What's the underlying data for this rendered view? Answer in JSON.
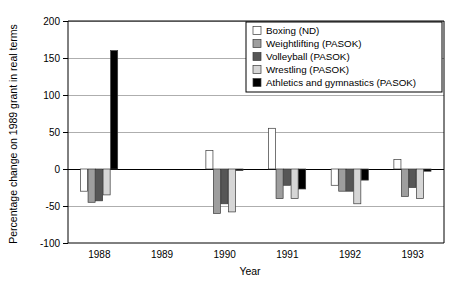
{
  "chart_data": {
    "type": "bar",
    "title": "",
    "xlabel": "Year",
    "ylabel": "Percentage change on 1989 grant in real terms",
    "categories": [
      "1988",
      "1989",
      "1990",
      "1991",
      "1992",
      "1993"
    ],
    "ylim": [
      -100,
      200
    ],
    "yticks": [
      200,
      150,
      100,
      50,
      0,
      -50,
      -100
    ],
    "ytick_labels": [
      "200",
      "150",
      "100",
      "50",
      "0",
      "-50",
      "-100"
    ],
    "grid": true,
    "legend_position": "top-right",
    "series": [
      {
        "name": "Boxing (ND)",
        "color": "#ffffff",
        "values": [
          -30,
          null,
          25,
          55,
          -22,
          13
        ]
      },
      {
        "name": "Weightlifting (PASOK)",
        "color": "#9e9e9e",
        "values": [
          -45,
          null,
          -60,
          -40,
          -30,
          -37
        ]
      },
      {
        "name": "Volleyball (PASOK)",
        "color": "#565656",
        "values": [
          -43,
          null,
          -47,
          -22,
          -30,
          -25
        ]
      },
      {
        "name": "Wrestling (PASOK)",
        "color": "#d6d6d6",
        "values": [
          -35,
          null,
          -58,
          -40,
          -47,
          -40
        ]
      },
      {
        "name": "Athletics and gymnastics (PASOK)",
        "color": "#000000",
        "values": [
          160,
          null,
          -2,
          -27,
          -15,
          -3
        ]
      }
    ]
  },
  "legend": {
    "entries": [
      "Boxing (ND)",
      "Weightlifting (PASOK)",
      "Volleyball (PASOK)",
      "Wrestling (PASOK)",
      "Athletics and gymnastics (PASOK)"
    ]
  },
  "axes": {
    "y_title": "Percentage change on 1989 grant in real terms",
    "x_title": "Year"
  }
}
